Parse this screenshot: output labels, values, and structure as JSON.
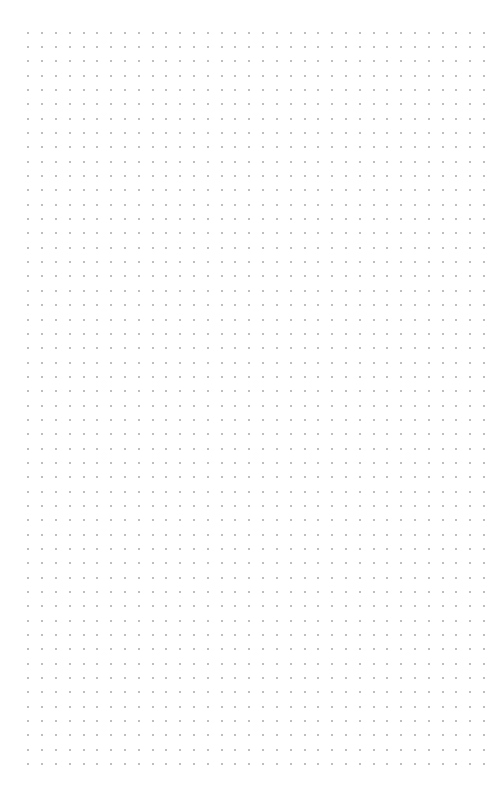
{
  "page": {
    "type": "dot-grid-sheet",
    "background_color": "#ffffff"
  },
  "grid": {
    "dot_color": "#a9a9a9",
    "columns": 34,
    "rows": 52,
    "origin_x": 28.3,
    "origin_y": 32.7,
    "spacing_x": 13.81,
    "spacing_y": 14.34,
    "dot_size": 2
  }
}
